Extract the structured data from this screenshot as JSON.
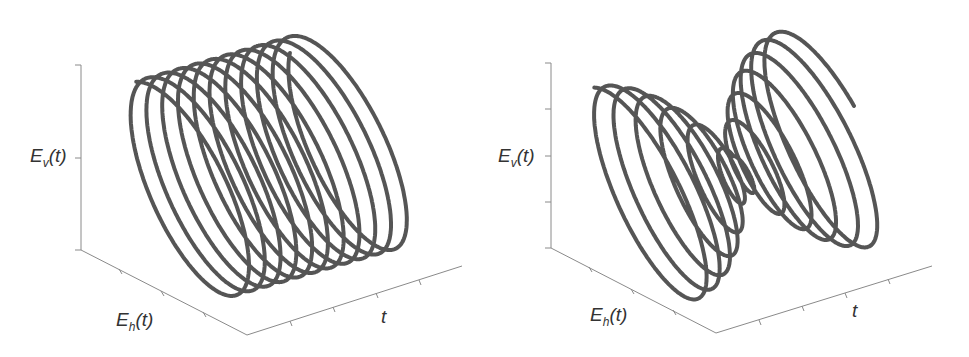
{
  "figure": {
    "panels": [
      {
        "id": "left",
        "description": "Uniform helix (constant-amplitude circular polarization over time)",
        "axes": {
          "z_label_main": "E",
          "z_label_sub": "v",
          "z_label_arg": "(t)",
          "x_label_main": "E",
          "x_label_sub": "h",
          "x_label_arg": "(t)",
          "y_label": "t"
        }
      },
      {
        "id": "right",
        "description": "Helix with amplitude decreasing then increasing (beat / envelope)",
        "axes": {
          "z_label_main": "E",
          "z_label_sub": "v",
          "z_label_arg": "(t)",
          "x_label_main": "E",
          "x_label_sub": "h",
          "x_label_arg": "(t)",
          "y_label": "t"
        }
      }
    ],
    "colors": {
      "curve": "#555555",
      "axis": "#8a8a8a",
      "text": "#333333"
    }
  },
  "chart_data": [
    {
      "type": "line",
      "title": "",
      "subtype": "3d-helix",
      "xlabel": "E_h(t)",
      "ylabel": "t",
      "zlabel": "E_v(t)",
      "turns": 11,
      "amplitude": "constant",
      "grid": false
    },
    {
      "type": "line",
      "title": "",
      "subtype": "3d-helix",
      "xlabel": "E_h(t)",
      "ylabel": "t",
      "zlabel": "E_v(t)",
      "turns": 12,
      "amplitude": "large-small-large envelope",
      "grid": false
    }
  ]
}
